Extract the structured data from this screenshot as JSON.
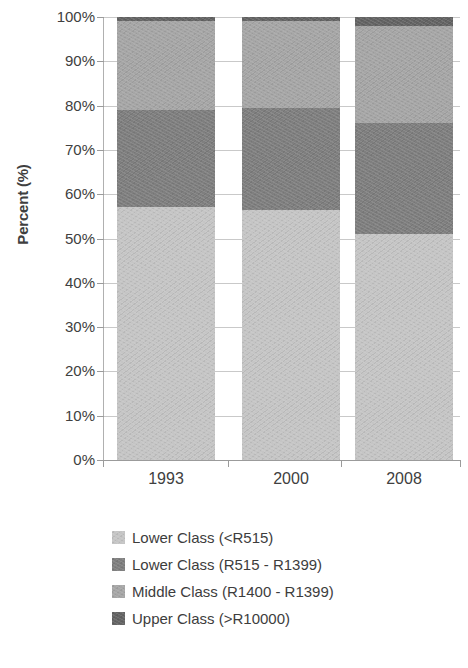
{
  "chart_data": {
    "type": "bar",
    "subtype": "stacked-100-percent",
    "title": "",
    "xlabel": "",
    "ylabel": "Percent (%)",
    "ylim": [
      0,
      100
    ],
    "grid": true,
    "legend_position": "bottom",
    "categories": [
      "1993",
      "2000",
      "2008"
    ],
    "ytick_labels": [
      "0%",
      "10%",
      "20%",
      "30%",
      "40%",
      "50%",
      "60%",
      "70%",
      "80%",
      "90%",
      "100%"
    ],
    "ytick_values": [
      0,
      10,
      20,
      30,
      40,
      50,
      60,
      70,
      80,
      90,
      100
    ],
    "series": [
      {
        "name": "Lower Class (<R515)",
        "color": "#c5c5c5",
        "values": [
          57,
          56.5,
          51
        ]
      },
      {
        "name": "Lower Class (R515 - R1399)",
        "color": "#7f7f7f",
        "values": [
          22,
          23,
          25
        ]
      },
      {
        "name": "Middle Class (R1400 - R1399)",
        "color": "#a6a6a6",
        "values": [
          20,
          19.5,
          22
        ]
      },
      {
        "name": "Upper Class (>R10000)",
        "color": "#646464",
        "values": [
          1,
          1,
          2
        ]
      }
    ]
  },
  "axis": {
    "y_title": "Percent (%)"
  },
  "legend": {
    "items": [
      {
        "label": "Lower Class (<R515)",
        "color": "#c5c5c5"
      },
      {
        "label": "Lower Class (R515 - R1399)",
        "color": "#7f7f7f"
      },
      {
        "label": "Middle Class (R1400 - R1399)",
        "color": "#a6a6a6"
      },
      {
        "label": "Upper Class (>R10000)",
        "color": "#646464"
      }
    ]
  }
}
